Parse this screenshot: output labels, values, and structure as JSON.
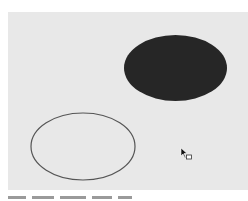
{
  "canvas": {
    "background": "#e8e8e8",
    "shapes": [
      {
        "type": "ellipse",
        "style": "filled",
        "cx": 175.5,
        "cy": 68,
        "rx": 51.5,
        "ry": 33,
        "fill": "#262626"
      },
      {
        "type": "ellipse",
        "style": "outline",
        "cx": 83,
        "cy": 146.5,
        "rx": 52,
        "ry": 33.5,
        "stroke": "#555555"
      }
    ]
  },
  "cursor": {
    "icon": "drag-copy-cursor-icon",
    "x": 181,
    "y": 148
  }
}
